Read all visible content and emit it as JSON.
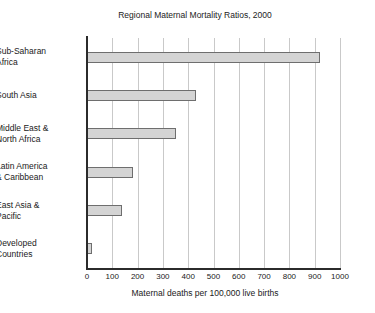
{
  "chart_data": {
    "type": "bar",
    "orientation": "horizontal",
    "title": "Regional Maternal Mortality Ratios, 2000",
    "xlabel": "Maternal deaths per 100,000 live births",
    "ylabel": "",
    "xlim": [
      0,
      1000
    ],
    "xticks": [
      0,
      100,
      200,
      300,
      400,
      500,
      600,
      700,
      800,
      900,
      1000
    ],
    "xtick_labels": [
      "0",
      "100",
      "200",
      "300",
      "400",
      "500",
      "600",
      "700",
      "800",
      "900",
      "1000"
    ],
    "grid": "vertical",
    "legend": "none",
    "bar_color": "#d4d4d4",
    "bar_edge_color": "#6e6e6e",
    "categories": [
      "Sub-Saharan Africa",
      "South Asia",
      "Middle East & North Africa",
      "Latin America & Caribbean",
      "East Asia & Pacific",
      "Developed Countries"
    ],
    "category_lines": [
      [
        "Sub-Saharan",
        "Africa"
      ],
      [
        "South Asia"
      ],
      [
        "Middle East &",
        "North Africa"
      ],
      [
        "Latin America",
        "& Caribbean"
      ],
      [
        "East Asia &",
        "Pacific"
      ],
      [
        "Developed",
        "Countries"
      ]
    ],
    "values": [
      920,
      430,
      350,
      180,
      140,
      20
    ]
  }
}
